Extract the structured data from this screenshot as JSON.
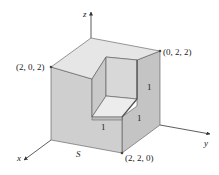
{
  "diagram": {
    "type": "3d-solid-surface",
    "axes": {
      "x_label": "x",
      "y_label": "y",
      "z_label": "z"
    },
    "vertex_labels": {
      "top_left": "(2, 0, 2)",
      "top_right": "(0, 2, 2)",
      "bottom_front": "(2, 2, 0)"
    },
    "edge_labels": {
      "notch_bottom": "1",
      "notch_right": "1",
      "notch_vertical": "1"
    },
    "surface_label": "S",
    "colors": {
      "top_face": "#e6e6e6",
      "left_face": "#cfcfcf",
      "right_face": "#c4c4c4",
      "notch_back": "#d8d8d8",
      "notch_floor": "#ececec",
      "edge": "#555555"
    }
  }
}
